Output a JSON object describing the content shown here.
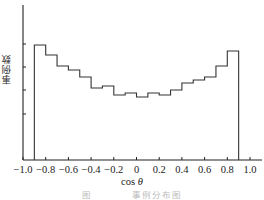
{
  "chart_data": {
    "type": "bar",
    "subtype": "step-histogram",
    "title": "",
    "xlabel": "cos θ",
    "ylabel": "事例数",
    "xlim": [
      -1.0,
      1.05
    ],
    "x_ticks": [
      -1.0,
      -0.8,
      -0.6,
      -0.4,
      -0.2,
      0,
      0.2,
      0.4,
      0.6,
      0.8,
      1.0
    ],
    "x_tick_labels": [
      "−1.0",
      "−0.8",
      "−0.6",
      "−0.4",
      "−0.2",
      "0",
      "0.2",
      "0.4",
      "0.6",
      "0.8",
      "1.0"
    ],
    "y_ticks_count": 4,
    "y_tick_labels": [],
    "grid": false,
    "legend": null,
    "bin_edges": [
      -0.9,
      -0.8,
      -0.7,
      -0.6,
      -0.5,
      -0.4,
      -0.3,
      -0.2,
      -0.1,
      0.0,
      0.1,
      0.2,
      0.3,
      0.4,
      0.5,
      0.6,
      0.7,
      0.8,
      0.9
    ],
    "categories": [
      "-0.85",
      "-0.75",
      "-0.65",
      "-0.55",
      "-0.45",
      "-0.35",
      "-0.25",
      "-0.15",
      "-0.05",
      "0.05",
      "0.15",
      "0.25",
      "0.35",
      "0.45",
      "0.55",
      "0.65",
      "0.75",
      "0.85"
    ],
    "values": [
      115,
      105,
      94,
      90,
      83,
      72,
      74,
      65,
      67,
      63,
      67,
      65,
      70,
      77,
      80,
      83,
      94,
      109
    ],
    "value_units": "relative counts (y-axis unlabeled; values in arbitrary units)",
    "ylim": [
      0,
      155
    ]
  },
  "labels": {
    "xlabel_main": "cos ",
    "xlabel_theta": "θ",
    "ylabel": "事例数",
    "caption_prefix": "图",
    "caption_text": "事例分布图"
  },
  "style": {
    "line_color": "#333333",
    "axis_color": "#222222"
  }
}
